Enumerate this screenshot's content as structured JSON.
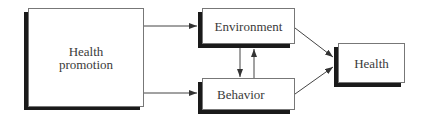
{
  "diagram": {
    "type": "flow",
    "nodes": [
      {
        "id": "health_promotion",
        "label_line1": "Health",
        "label_line2": "promotion"
      },
      {
        "id": "environment",
        "label": "Environment"
      },
      {
        "id": "behavior",
        "label": "Behavior"
      },
      {
        "id": "health",
        "label": "Health"
      }
    ],
    "edges": [
      {
        "from": "health_promotion",
        "to": "environment"
      },
      {
        "from": "health_promotion",
        "to": "behavior"
      },
      {
        "from": "environment",
        "to": "behavior"
      },
      {
        "from": "behavior",
        "to": "environment"
      },
      {
        "from": "environment",
        "to": "health"
      },
      {
        "from": "behavior",
        "to": "health"
      }
    ],
    "colors": {
      "line": "#444444",
      "shadow": "#1a1a1a",
      "border": "#777777"
    }
  }
}
